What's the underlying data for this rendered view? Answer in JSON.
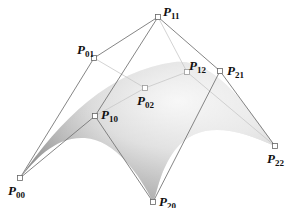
{
  "figure": {
    "surface_fill_dark": "#8e8e8e",
    "surface_fill_light": "#f2f2f2",
    "net_line_color": "#777777",
    "hidden_line_color": "#c8c8c8",
    "point_fill": "#ffffff",
    "point_stroke": "#666666"
  },
  "control_points": [
    {
      "id": "P00",
      "base": "P",
      "sub": "00",
      "x": 20,
      "y": 178,
      "label_x": 8,
      "label_y": 184
    },
    {
      "id": "P01",
      "base": "P",
      "sub": "01",
      "x": 94,
      "y": 58,
      "label_x": 77,
      "label_y": 43
    },
    {
      "id": "P02",
      "base": "P",
      "sub": "02",
      "x": 145,
      "y": 88,
      "label_x": 137,
      "label_y": 94
    },
    {
      "id": "P10",
      "base": "P",
      "sub": "10",
      "x": 95,
      "y": 116,
      "label_x": 101,
      "label_y": 108
    },
    {
      "id": "P11",
      "base": "P",
      "sub": "11",
      "x": 158,
      "y": 17,
      "label_x": 163,
      "label_y": 5
    },
    {
      "id": "P12",
      "base": "P",
      "sub": "12",
      "x": 187,
      "y": 72,
      "label_x": 189,
      "label_y": 59
    },
    {
      "id": "P20",
      "base": "P",
      "sub": "20",
      "x": 153,
      "y": 202,
      "label_x": 159,
      "label_y": 195
    },
    {
      "id": "P21",
      "base": "P",
      "sub": "21",
      "x": 220,
      "y": 71,
      "label_x": 227,
      "label_y": 64
    },
    {
      "id": "P22",
      "base": "P",
      "sub": "22",
      "x": 275,
      "y": 146,
      "label_x": 267,
      "label_y": 152
    }
  ],
  "net_edges": [
    [
      "P00",
      "P01"
    ],
    [
      "P01",
      "P11"
    ],
    [
      "P11",
      "P21"
    ],
    [
      "P21",
      "P22"
    ],
    [
      "P00",
      "P10"
    ],
    [
      "P10",
      "P20"
    ],
    [
      "P11",
      "P10"
    ],
    [
      "P21",
      "P20"
    ]
  ],
  "hidden_edges": [
    [
      "P01",
      "P02"
    ],
    [
      "P02",
      "P12"
    ],
    [
      "P11",
      "P12"
    ],
    [
      "P12",
      "P22"
    ],
    [
      "P10",
      "P02"
    ]
  ]
}
